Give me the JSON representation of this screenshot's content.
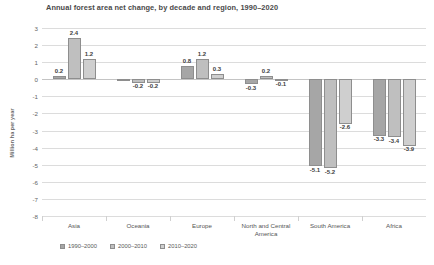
{
  "chart_data": {
    "type": "bar",
    "title": "Annual forest area net change, by decade and region, 1990–2020",
    "xlabel": "",
    "ylabel": "Million ha per year",
    "ylim": [
      -8,
      3
    ],
    "yticks": [
      3,
      2,
      1,
      0,
      -1,
      -2,
      -3,
      -4,
      -5,
      -6,
      -7,
      -8
    ],
    "grid": true,
    "legend_position": "bottom-left",
    "categories": [
      "Asia",
      "Oceania",
      "Europe",
      "North and Central America",
      "South America",
      "Africa"
    ],
    "series": [
      {
        "name": "1990–2000",
        "color": "#a6a6a6",
        "values": [
          0.2,
          0.0,
          0.8,
          -0.3,
          -5.1,
          -3.3
        ],
        "labels": [
          "0.2",
          "",
          "0.8",
          "-0.3",
          "-5.1",
          "-3.3"
        ]
      },
      {
        "name": "2000–2010",
        "color": "#bfbfbf",
        "values": [
          2.4,
          -0.2,
          1.2,
          0.2,
          -5.2,
          -3.4
        ],
        "labels": [
          "2.4",
          "-0.2",
          "1.2",
          "0.2",
          "-5.2",
          "-3.4"
        ]
      },
      {
        "name": "2010–2020",
        "color": "#cfcfcf",
        "values": [
          1.2,
          -0.2,
          0.3,
          -0.1,
          -2.6,
          -3.9
        ],
        "labels": [
          "1.2",
          "-0.2",
          "0.3",
          "-0.1",
          "-2.6",
          "-3.9"
        ]
      }
    ]
  }
}
